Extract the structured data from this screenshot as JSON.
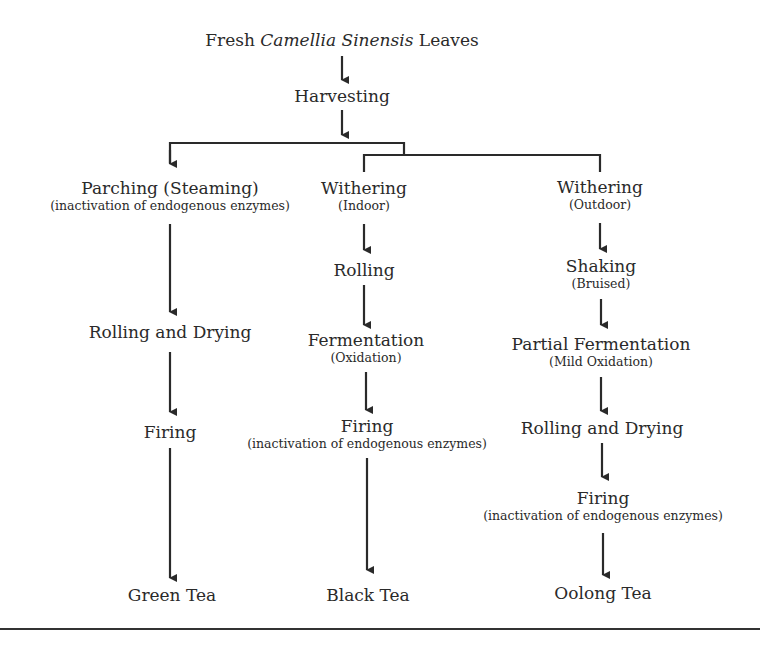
{
  "diagram": {
    "root": {
      "prefix": "Fresh ",
      "italic": "Camellia Sinensis",
      "suffix": " Leaves"
    },
    "harvest": "Harvesting",
    "columns": [
      {
        "name": "green",
        "steps": [
          {
            "label": "Parching (Steaming)",
            "note": "(inactivation of endogenous enzymes)"
          },
          {
            "label": "Rolling and Drying"
          },
          {
            "label": "Firing"
          },
          {
            "label": "Green Tea"
          }
        ]
      },
      {
        "name": "black",
        "steps": [
          {
            "label": "Withering",
            "note": "(Indoor)"
          },
          {
            "label": "Rolling"
          },
          {
            "label": "Fermentation",
            "note": "(Oxidation)"
          },
          {
            "label": "Firing",
            "note": "(inactivation of endogenous enzymes)"
          },
          {
            "label": "Black Tea"
          }
        ]
      },
      {
        "name": "oolong",
        "steps": [
          {
            "label": "Withering",
            "note": "(Outdoor)"
          },
          {
            "label": "Shaking",
            "note": "(Bruised)"
          },
          {
            "label": "Partial Fermentation",
            "note": "(Mild Oxidation)"
          },
          {
            "label": "Rolling and Drying"
          },
          {
            "label": "Firing",
            "note": "(inactivation of endogenous enzymes)"
          },
          {
            "label": "Oolong Tea"
          }
        ]
      }
    ],
    "line_color": "#2a2a2a"
  }
}
